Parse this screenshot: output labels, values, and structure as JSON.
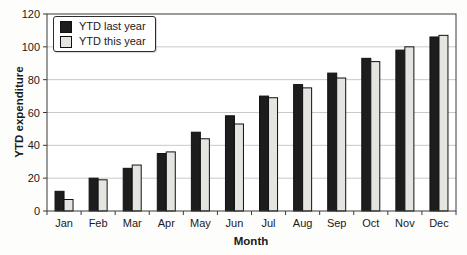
{
  "chart_data": {
    "type": "bar",
    "title": "",
    "xlabel": "Month",
    "ylabel": "YTD expenditure",
    "categories": [
      "Jan",
      "Feb",
      "Mar",
      "Apr",
      "May",
      "Jun",
      "Jul",
      "Aug",
      "Sep",
      "Oct",
      "Nov",
      "Dec"
    ],
    "series": [
      {
        "name": "YTD last year",
        "color": "#1d1d1d",
        "values": [
          12,
          20,
          26,
          35,
          48,
          58,
          70,
          77,
          84,
          93,
          98,
          106
        ]
      },
      {
        "name": "YTD this year",
        "color": "#e4e4e1",
        "values": [
          7,
          19,
          28,
          36,
          44,
          53,
          69,
          75,
          81,
          91,
          100,
          107
        ]
      }
    ],
    "ylim": [
      0,
      120
    ],
    "ytick_step": 20,
    "yticks": [
      0,
      20,
      40,
      60,
      80,
      100,
      120
    ],
    "grid": "horizontal",
    "legend_position": "top-left"
  },
  "colors": {
    "background": "#fdfdfc",
    "plot_background": "#ffffff",
    "plot_border": "#3a3a3a",
    "gridline": "#c9c9c9",
    "bar_outline": "#111111",
    "tick": "#3a3a3a",
    "text": "#1a1a1a"
  }
}
